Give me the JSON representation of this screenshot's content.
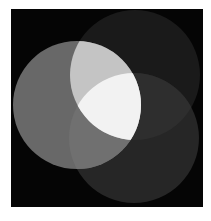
{
  "figure": {
    "page_background": "#ffffff",
    "panel": {
      "x": 11,
      "y": 9,
      "width": 192,
      "height": 198,
      "color": "#050505"
    },
    "circles": [
      {
        "id": "A",
        "label": "left-circle",
        "cx": 77,
        "cy": 105,
        "r": 64
      },
      {
        "id": "B",
        "label": "top-right-circle",
        "cx": 135,
        "cy": 75,
        "r": 65
      },
      {
        "id": "C",
        "label": "bottom-right-circle",
        "cx": 134,
        "cy": 138,
        "r": 65
      }
    ],
    "region_colors": {
      "A": "#686868",
      "B": "#1a1a1a",
      "C": "#262626",
      "AB": "#c4c4c4",
      "AC": "#707070",
      "BC": "#2e2e2e",
      "ABC": "#f2f2f2"
    }
  }
}
